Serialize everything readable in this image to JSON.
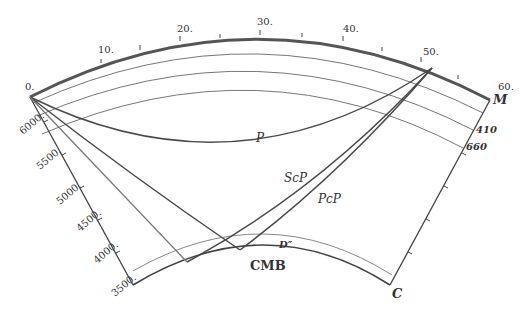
{
  "diagram": {
    "distance_axis": {
      "unit": "degrees",
      "ticks": [
        "0.",
        "10.",
        "20.",
        "30.",
        "40.",
        "50.",
        "60."
      ]
    },
    "radius_axis": {
      "unit": "km",
      "ticks": [
        "6000.",
        "5500.",
        "5000.",
        "4500.",
        "4000.",
        "3500."
      ]
    },
    "layers": {
      "moho": "M",
      "d410": "410",
      "d660": "660",
      "d_double_prime": "D″",
      "cmb": "CMB",
      "core": "C"
    },
    "phases": {
      "p": "P",
      "scp": "ScP",
      "pcp": "PcP"
    },
    "colors": {
      "surface": "#555555",
      "ray": "#4a4a4a",
      "layer_line": "#6a6a6a",
      "text": "#333333"
    }
  }
}
